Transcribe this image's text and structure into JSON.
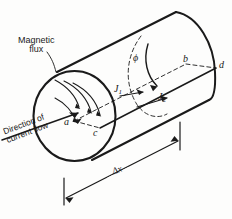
{
  "figure": {
    "background_color": "#fdfdfc",
    "ink_color": "#1a1a1a"
  },
  "labels": {
    "magnetic_flux_line1": "Magnetic",
    "magnetic_flux_line2": "flux",
    "direction_line1": "Direction of",
    "direction_line2": "current flow",
    "point_a": "a",
    "point_b": "b",
    "point_c": "c",
    "point_d": "d",
    "flux_symbol": "ϕ",
    "current_density_1": "J",
    "current_density_1_sub": "1",
    "current_density_2": "J",
    "current_density_2_sub": "2",
    "length_symbol": "Δx"
  },
  "icons": {
    "flux_arrow": "curved-arrow-icon",
    "current_arrow": "straight-arrow-icon",
    "dimension_arrow": "double-dimension-arrow-icon"
  }
}
